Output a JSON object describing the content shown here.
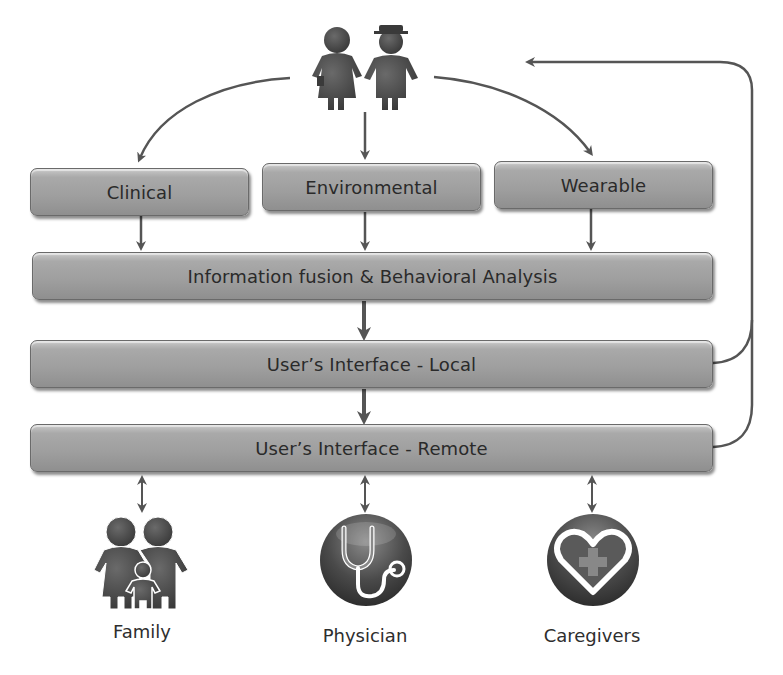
{
  "diagram": {
    "top_actor": {
      "icon": "elderly-couple-icon"
    },
    "sources": [
      {
        "label": "Clinical"
      },
      {
        "label": "Environmental"
      },
      {
        "label": "Wearable"
      }
    ],
    "layers": [
      {
        "label": "Information fusion & Behavioral Analysis"
      },
      {
        "label": "User’s Interface - Local"
      },
      {
        "label": "User’s Interface - Remote"
      }
    ],
    "stakeholders": [
      {
        "label": "Family",
        "icon": "family-icon"
      },
      {
        "label": "Physician",
        "icon": "stethoscope-icon"
      },
      {
        "label": "Caregivers",
        "icon": "heart-plus-icon"
      }
    ],
    "colors": {
      "box_fill": "#a3a3a3",
      "box_border": "#6a6a6a",
      "text": "#2a2a2a",
      "arrow": "#555555",
      "icon_dark": "#4a4a4a"
    }
  }
}
